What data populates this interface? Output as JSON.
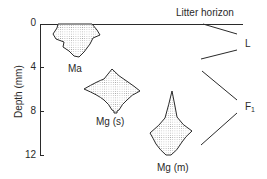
{
  "figure": {
    "y_axis": {
      "label": "Depth (mm)",
      "ticks": [
        "0",
        "4",
        "8",
        "12"
      ]
    },
    "horizon_labels": {
      "litter": "Litter horizon",
      "L": "L",
      "F": "F",
      "F_sub": "1"
    },
    "distributions": [
      {
        "label": "Ma",
        "depth_range_mm": [
          0,
          3
        ]
      },
      {
        "label": "Mg (s)",
        "depth_range_mm": [
          4,
          8.5
        ]
      },
      {
        "label": "Mg (m)",
        "depth_range_mm": [
          6,
          12
        ]
      }
    ],
    "colors": {
      "ink": "#2a2a2a",
      "stipple": "#9a9a9a"
    }
  }
}
